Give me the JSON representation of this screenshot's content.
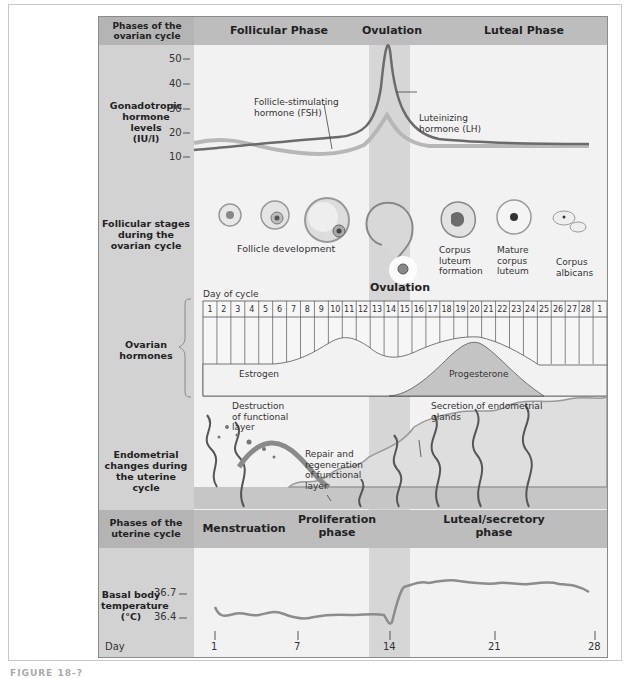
{
  "figure": {
    "caption_partial": "FIGURE 18-?",
    "colors": {
      "header_band": "#bdbdbd",
      "left_column": "#d2d2d2",
      "ovulation_band": "#d6d6d6",
      "panel": "#f2f2f2",
      "lh_line": "#6b6b6b",
      "fsh_line": "#b5b5b5",
      "progesterone_fill": "#c4c4c4",
      "temp_line": "#8c8c8c"
    }
  },
  "ovarian_phases": {
    "row_label": "Phases of the ovarian cycle",
    "follicular": "Follicular Phase",
    "ovulation": "Ovulation",
    "luteal": "Luteal Phase"
  },
  "gonadotropic": {
    "row_label_lines": [
      "Gonadotropic",
      "hormone",
      "levels",
      "(IU/l)"
    ],
    "y_ticks": [
      "50",
      "40",
      "30",
      "20",
      "10"
    ],
    "fsh_label_lines": [
      "Follicle-stimulating",
      "hormone (FSH)"
    ],
    "lh_label_lines": [
      "Luteinizing",
      "hormone (LH)"
    ]
  },
  "follicular_stages": {
    "row_label_lines": [
      "Follicular stages",
      "during the",
      "ovarian cycle"
    ],
    "follicle_development": "Follicle development",
    "ovulation": "Ovulation",
    "corpus_luteum_formation": [
      "Corpus",
      "luteum",
      "formation"
    ],
    "mature_corpus_luteum": [
      "Mature",
      "corpus",
      "luteum"
    ],
    "corpus_albicans": [
      "Corpus",
      "albicans"
    ]
  },
  "ovarian_hormones": {
    "row_label_lines": [
      "Ovarian",
      "hormones"
    ],
    "day_of_cycle_label": "Day of cycle",
    "days": [
      "1",
      "2",
      "3",
      "4",
      "5",
      "6",
      "7",
      "8",
      "9",
      "10",
      "11",
      "12",
      "13",
      "14",
      "15",
      "16",
      "17",
      "18",
      "19",
      "20",
      "21",
      "22",
      "23",
      "24",
      "25",
      "26",
      "27",
      "28",
      "1"
    ],
    "estrogen": "Estrogen",
    "progesterone": "Progesterone"
  },
  "endometrial": {
    "row_label_lines": [
      "Endometrial",
      "changes during",
      "the uterine",
      "cycle"
    ],
    "destruction_lines": [
      "Destruction",
      "of functional",
      "layer"
    ],
    "repair_lines": [
      "Repair and",
      "regeneration",
      "of functional",
      "layer"
    ],
    "secretion_lines": [
      "Secretion of endometrial",
      "glands"
    ]
  },
  "uterine_phases": {
    "row_label_lines": [
      "Phases of the",
      "uterine cycle"
    ],
    "menstruation": "Menstruation",
    "proliferation_lines": [
      "Proliferation",
      "phase"
    ],
    "luteal_lines": [
      "Luteal/secretory",
      "phase"
    ]
  },
  "basal_temp": {
    "row_label_lines": [
      "Basal body",
      "temperature",
      "(°C)"
    ],
    "y_ticks": [
      "36.7",
      "36.4"
    ],
    "x_label": "Day",
    "x_ticks": [
      "1",
      "7",
      "14",
      "21",
      "28"
    ]
  },
  "chart_data": [
    {
      "type": "line",
      "title": "Gonadotropic hormone levels (IU/l)",
      "xlabel": "Day of cycle",
      "ylabel": "IU/l",
      "ylim": [
        10,
        50
      ],
      "x": [
        1,
        4,
        7,
        10,
        12,
        13,
        14,
        15,
        16,
        18,
        21,
        24,
        28
      ],
      "series": [
        {
          "name": "Luteinizing hormone (LH)",
          "values": [
            13,
            14,
            14.5,
            15.5,
            17,
            22,
            50,
            24,
            15,
            13,
            12.5,
            12.5,
            12.5
          ]
        },
        {
          "name": "Follicle-stimulating hormone (FSH)",
          "values": [
            15,
            16,
            14,
            11,
            11,
            14,
            21,
            15,
            12,
            11,
            11,
            11,
            11
          ]
        }
      ]
    },
    {
      "type": "area",
      "title": "Ovarian hormones",
      "xlabel": "Day of cycle",
      "x": [
        1,
        5,
        8,
        10,
        12,
        14,
        15,
        17,
        20,
        21,
        23,
        25,
        27,
        28
      ],
      "series": [
        {
          "name": "Estrogen",
          "values": [
            0.1,
            0.1,
            0.25,
            0.45,
            0.65,
            0.38,
            0.38,
            0.55,
            0.8,
            0.82,
            0.65,
            0.3,
            0.1,
            0.1
          ]
        },
        {
          "name": "Progesterone",
          "values": [
            0,
            0,
            0,
            0,
            0,
            0.03,
            0.15,
            0.45,
            0.78,
            0.82,
            0.55,
            0.2,
            0.02,
            0
          ]
        }
      ]
    },
    {
      "type": "line",
      "title": "Basal body temperature (°C)",
      "xlabel": "Day",
      "ylabel": "°C",
      "x_ticks": [
        1,
        7,
        14,
        21,
        28
      ],
      "y_ticks": [
        36.4,
        36.7
      ],
      "x": [
        1,
        2,
        3,
        4,
        5,
        6,
        7,
        8,
        9,
        10,
        11,
        12,
        13,
        13.5,
        14,
        14.5,
        15,
        16,
        17,
        18,
        19,
        20,
        21,
        22,
        23,
        24,
        25,
        26,
        27,
        28
      ],
      "series": [
        {
          "name": "Basal body temperature",
          "values": [
            36.5,
            36.41,
            36.43,
            36.4,
            36.42,
            36.4,
            36.42,
            36.36,
            36.36,
            36.38,
            36.37,
            36.38,
            36.38,
            36.36,
            36.28,
            36.5,
            36.7,
            36.72,
            36.73,
            36.75,
            36.75,
            36.73,
            36.71,
            36.7,
            36.71,
            36.7,
            36.7,
            36.72,
            36.68,
            36.62
          ]
        }
      ]
    }
  ]
}
